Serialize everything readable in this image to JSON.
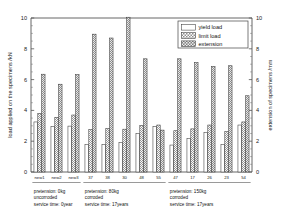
{
  "chart_data": {
    "type": "bar",
    "title": "",
    "ylabel": "load applied on the specimens /kN",
    "y2label": "extension of specimens /mm",
    "xlabel": "",
    "ylim": [
      0,
      10
    ],
    "y2lim": [
      0,
      10
    ],
    "yticks": [
      0,
      2,
      4,
      6,
      8,
      10
    ],
    "y2ticks": [
      0,
      2,
      4,
      6,
      8,
      10
    ],
    "grid": false,
    "legend_position": "top-right",
    "categories": [
      "new1",
      "new2",
      "new3",
      "37",
      "38",
      "30",
      "48",
      "55",
      "47",
      "17",
      "26",
      "23",
      "54"
    ],
    "series": [
      {
        "name": "yield load",
        "unit": "kN",
        "axis": "left",
        "fill": "white",
        "values": [
          3.25,
          2.95,
          2.98,
          1.78,
          1.8,
          1.93,
          2.5,
          2.95,
          1.75,
          2.18,
          2.58,
          1.78,
          3.05
        ]
      },
      {
        "name": "limit load",
        "unit": "kN",
        "axis": "left",
        "fill": "light-dotted",
        "values": [
          3.8,
          3.55,
          3.7,
          2.75,
          2.82,
          2.78,
          3.02,
          3.05,
          2.68,
          2.8,
          3.05,
          2.62,
          3.25
        ]
      },
      {
        "name": "extension",
        "unit": "mm",
        "axis": "right",
        "fill": "dark-dotted",
        "values": [
          6.35,
          5.7,
          6.32,
          8.95,
          8.7,
          10.05,
          7.35,
          2.72,
          7.35,
          7.1,
          6.85,
          6.9,
          4.95
        ]
      }
    ],
    "group_annotations": [
      {
        "label": "group-1",
        "start_category": "new1",
        "end_category": "new3",
        "lines": [
          "pretension: 0kg",
          "uncorroded",
          "service time: 0year"
        ]
      },
      {
        "label": "group-2",
        "start_category": "37",
        "end_category": "55",
        "lines": [
          "pretension: 80kg",
          "corroded",
          "service time: 17years"
        ]
      },
      {
        "label": "group-3",
        "start_category": "47",
        "end_category": "54",
        "lines": [
          "pretension: 150kg",
          "corroded",
          "service time: 17years"
        ]
      }
    ]
  },
  "legend": {
    "items": [
      {
        "label": "yield load",
        "swatch": "white"
      },
      {
        "label": "limit load",
        "swatch": "light-dotted"
      },
      {
        "label": "extension",
        "swatch": "dark-dotted"
      }
    ]
  }
}
